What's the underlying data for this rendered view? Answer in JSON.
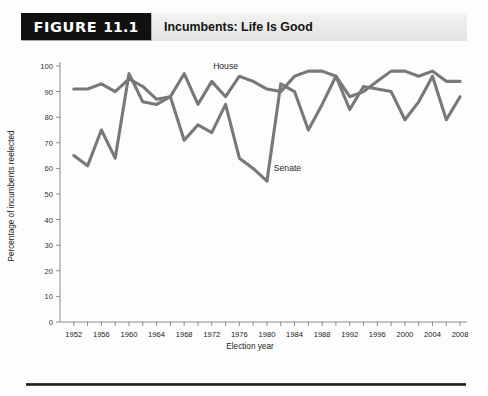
{
  "figure": {
    "badge_word": "Figure",
    "badge_number": "11.1",
    "title": "Incumbents: Life Is Good"
  },
  "chart_data": {
    "type": "line",
    "title": "Incumbents: Life Is Good",
    "xlabel": "Election year",
    "ylabel": "Percentage of incumbents reelected",
    "xlim": [
      1950,
      2009
    ],
    "ylim": [
      0,
      100
    ],
    "yticks": [
      0,
      10,
      20,
      30,
      40,
      50,
      60,
      70,
      80,
      90,
      100
    ],
    "ytick_labels": [
      "0",
      "10",
      "20",
      "30",
      "40",
      "50",
      "60",
      "70",
      "80",
      "90",
      "100"
    ],
    "xticks": [
      1952,
      1954,
      1956,
      1958,
      1960,
      1962,
      1964,
      1966,
      1968,
      1970,
      1972,
      1974,
      1976,
      1978,
      1980,
      1982,
      1984,
      1986,
      1988,
      1990,
      1992,
      1994,
      1996,
      1998,
      2000,
      2002,
      2004,
      2006,
      2008
    ],
    "xtick_labels": [
      "1952",
      "1956",
      "1960",
      "1964",
      "1968",
      "1972",
      "1976",
      "1980",
      "1984",
      "1988",
      "1992",
      "1996",
      "2000",
      "2004",
      "2008"
    ],
    "xtick_label_years": [
      1952,
      1956,
      1960,
      1964,
      1968,
      1972,
      1976,
      1980,
      1984,
      1988,
      1992,
      1996,
      2000,
      2004,
      2008
    ],
    "grid": false,
    "legend_position": "inline-labels",
    "line_color": "#787878",
    "x": [
      1952,
      1954,
      1956,
      1958,
      1960,
      1962,
      1964,
      1966,
      1968,
      1970,
      1972,
      1974,
      1976,
      1978,
      1980,
      1982,
      1984,
      1986,
      1988,
      1990,
      1992,
      1994,
      1996,
      1998,
      2000,
      2002,
      2004,
      2006,
      2008
    ],
    "series": [
      {
        "name": "House",
        "label_year": 1974,
        "label_value": 99,
        "values": [
          91,
          91,
          93,
          90,
          95,
          92,
          87,
          88,
          97,
          85,
          94,
          88,
          96,
          94,
          91,
          90,
          96,
          98,
          98,
          96,
          88,
          90,
          94,
          98,
          98,
          96,
          98,
          94,
          94
        ]
      },
      {
        "name": "Senate",
        "label_year": 1981,
        "label_value": 59,
        "values": [
          65,
          61,
          75,
          64,
          97,
          86,
          85,
          88,
          71,
          77,
          74,
          85,
          64,
          60,
          55,
          93,
          90,
          75,
          85,
          96,
          83,
          92,
          91,
          90,
          79,
          86,
          96,
          79,
          88
        ]
      }
    ]
  }
}
